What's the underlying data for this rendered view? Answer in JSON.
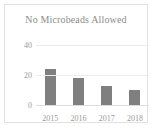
{
  "chart_data": {
    "type": "bar",
    "title": "No Microbeads Allowed",
    "xlabel": "",
    "ylabel": "",
    "categories": [
      "2015",
      "2016",
      "2017",
      "2018"
    ],
    "values": [
      24,
      18,
      13,
      10
    ],
    "ytick_labels": [
      "0",
      "20",
      "40"
    ],
    "ytick_values": [
      0,
      20,
      40
    ],
    "ylim": [
      0,
      40
    ],
    "grid": true,
    "legend": "none",
    "bar_color": "#7f7f7f",
    "text_color": "#8d8d8d",
    "gridline_color": "#ececec",
    "frame_color": "#e2e2e2",
    "background": "#ffffff"
  }
}
